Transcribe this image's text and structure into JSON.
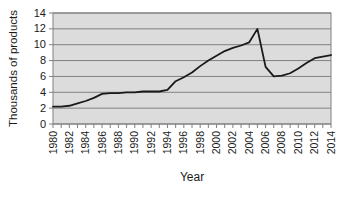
{
  "chart_data": {
    "type": "line",
    "title": "",
    "xlabel": "Year",
    "ylabel": "Thousands of products",
    "x": [
      1980,
      1981,
      1982,
      1983,
      1984,
      1985,
      1986,
      1987,
      1988,
      1989,
      1990,
      1991,
      1992,
      1993,
      1994,
      1995,
      1996,
      1997,
      1998,
      1999,
      2000,
      2001,
      2002,
      2003,
      2004,
      2005,
      2006,
      2007,
      2008,
      2009,
      2010,
      2011,
      2012,
      2013,
      2014
    ],
    "values": [
      2.2,
      2.2,
      2.3,
      2.6,
      2.9,
      3.3,
      3.8,
      3.9,
      3.9,
      4.0,
      4.0,
      4.1,
      4.1,
      4.1,
      4.3,
      5.4,
      5.9,
      6.5,
      7.3,
      8.0,
      8.6,
      9.2,
      9.6,
      9.9,
      10.3,
      12.0,
      7.2,
      6.0,
      6.1,
      6.4,
      7.0,
      7.7,
      8.3,
      8.5,
      8.7
    ],
    "ylim": [
      0,
      14
    ],
    "yticks": [
      0,
      2,
      4,
      6,
      8,
      10,
      12,
      14
    ],
    "xtick_labels": [
      "1980",
      "1982",
      "1984",
      "1986",
      "1988",
      "1990",
      "1992",
      "1994",
      "1996",
      "1998",
      "2000",
      "2002",
      "2004",
      "2006",
      "2008",
      "2010",
      "2012",
      "2014"
    ],
    "grid": "horizontal",
    "legend": "none",
    "colors": {
      "plot_bg": "#dcdcdc",
      "grid": "#808080",
      "border": "#808080",
      "line": "#1a1a1a",
      "text": "#1a1a1a"
    }
  }
}
